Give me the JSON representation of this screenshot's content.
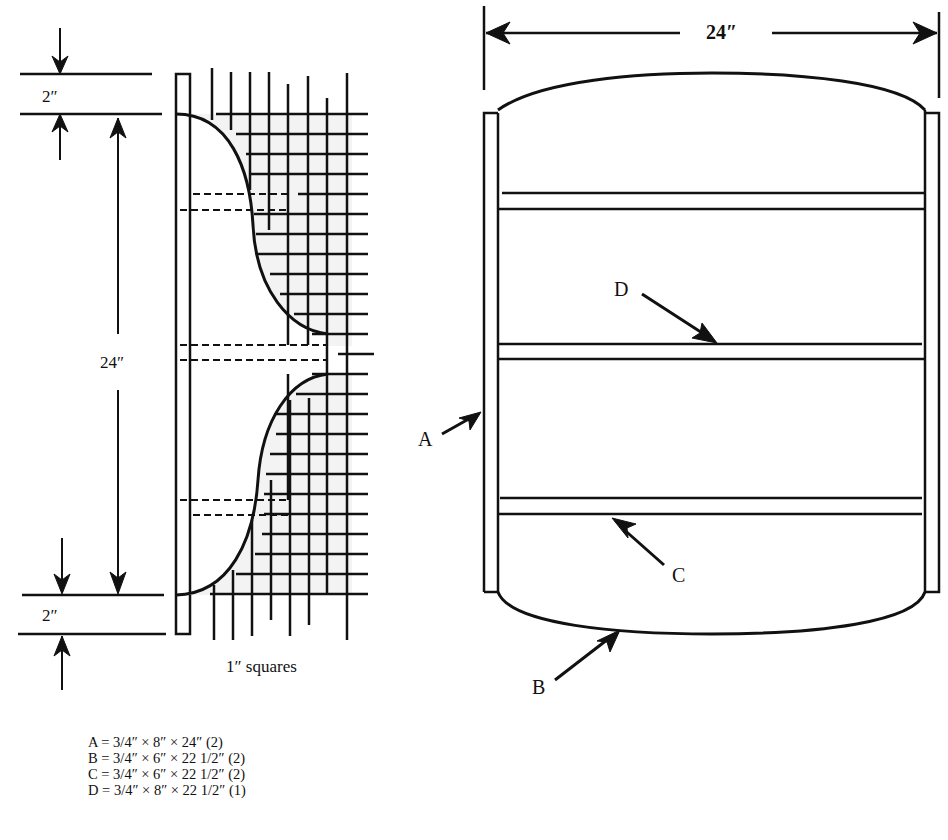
{
  "side_profile": {
    "top_margin_label": "2″",
    "height_label": "24″",
    "bottom_margin_label": "2″",
    "grid_caption": "1″ squares"
  },
  "front_view": {
    "width_label": "24″",
    "callouts": [
      {
        "letter": "A",
        "target": "side panel"
      },
      {
        "letter": "B",
        "target": "curved top/bottom"
      },
      {
        "letter": "C",
        "target": "shelf"
      },
      {
        "letter": "D",
        "target": "middle shelf"
      }
    ]
  },
  "parts_list": [
    {
      "part": "A",
      "text": "A = 3/4″ × 8″ × 24″ (2)"
    },
    {
      "part": "B",
      "text": "B = 3/4″ × 6″ × 22 1/2″ (2)"
    },
    {
      "part": "C",
      "text": "C = 3/4″ × 6″ × 22 1/2″ (2)"
    },
    {
      "part": "D",
      "text": "D = 3/4″ × 8″ × 22 1/2″ (1)"
    }
  ],
  "labels": {
    "A": "A",
    "B": "B",
    "C": "C",
    "D": "D"
  }
}
